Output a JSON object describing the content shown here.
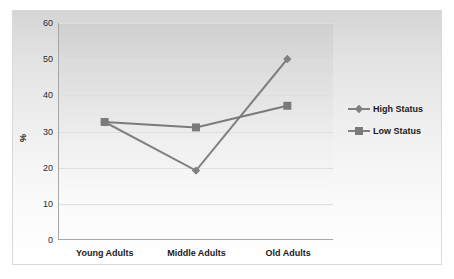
{
  "chart_data": {
    "type": "line",
    "title": "",
    "xlabel": "",
    "ylabel": "%",
    "categories": [
      "Young Adults",
      "Middle Adults",
      "Old Adults"
    ],
    "series": [
      {
        "name": "High Status",
        "values": [
          32.5,
          19,
          50
        ],
        "marker": "diamond",
        "color": "#808080"
      },
      {
        "name": "Low Status",
        "values": [
          32.5,
          31,
          37
        ],
        "marker": "square",
        "color": "#7a7a7a"
      }
    ],
    "ylim": [
      0,
      60
    ],
    "yticks": [
      0,
      10,
      20,
      30,
      40,
      50,
      60
    ],
    "ytick_labels": [
      "0",
      "10",
      "20",
      "30",
      "40",
      "50",
      "60"
    ],
    "grid": true,
    "legend_position": "right"
  },
  "axes": {
    "y_title": "%",
    "ticks": {
      "t0": "0",
      "t10": "10",
      "t20": "20",
      "t30": "30",
      "t40": "40",
      "t50": "50",
      "t60": "60"
    },
    "categories": {
      "c0": "Young Adults",
      "c1": "Middle Adults",
      "c2": "Old Adults"
    }
  },
  "legend": {
    "items": [
      {
        "label": "High Status"
      },
      {
        "label": "Low Status"
      }
    ]
  },
  "colors": {
    "line_high": "#808080",
    "line_low": "#7a7a7a",
    "gridline": "#dedede",
    "axis": "#a6a6a6",
    "frame_border": "#d9d9d9",
    "text": "#1a1a1a"
  }
}
